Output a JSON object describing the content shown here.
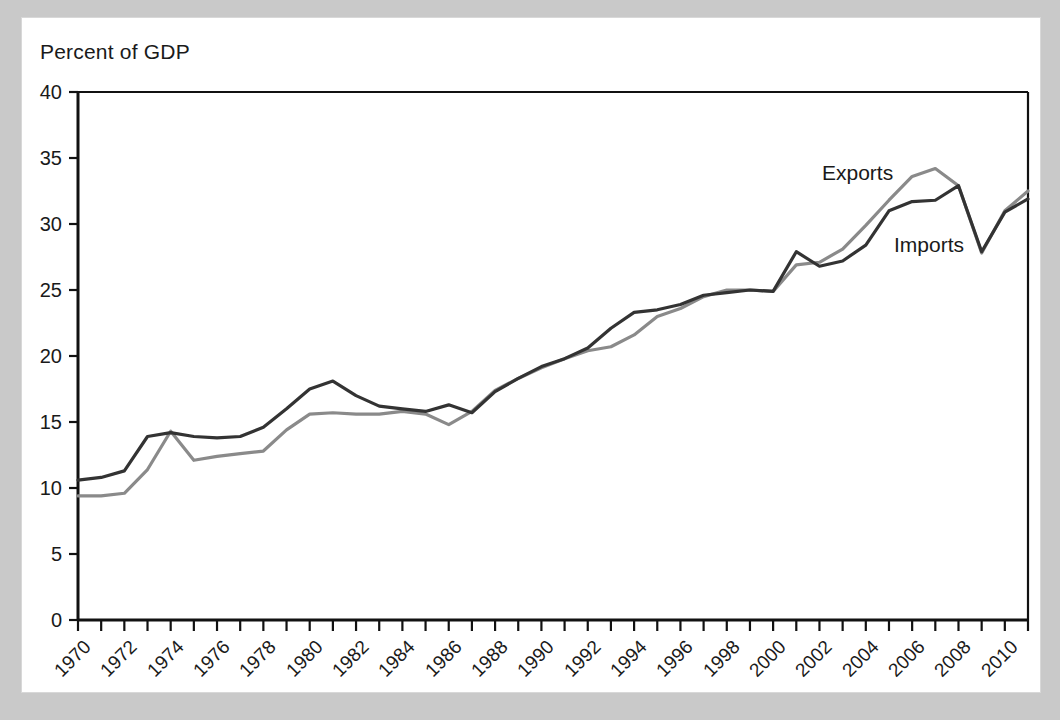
{
  "figure": {
    "axis_label": "Percent of GDP",
    "background_color": "#c9c9c9",
    "panel_color": "#ffffff"
  },
  "chart_data": {
    "type": "line",
    "title": "",
    "subtitle": "",
    "xlabel": "",
    "ylabel": "Percent of GDP",
    "xlim": [
      1970,
      2011
    ],
    "ylim": [
      0,
      40
    ],
    "grid": false,
    "legend_position": "inline-annotations",
    "ytick_labels": [
      "0",
      "5",
      "10",
      "15",
      "20",
      "25",
      "30",
      "35",
      "40"
    ],
    "ytick_values": [
      0,
      5,
      10,
      15,
      20,
      25,
      30,
      35,
      40
    ],
    "xtick_labels": [
      "1970",
      "1972",
      "1974",
      "1976",
      "1978",
      "1980",
      "1982",
      "1984",
      "1986",
      "1988",
      "1990",
      "1992",
      "1994",
      "1996",
      "1998",
      "2000",
      "2002",
      "2004",
      "2006",
      "2008",
      "2010"
    ],
    "xtick_values": [
      1970,
      1972,
      1974,
      1976,
      1978,
      1980,
      1982,
      1984,
      1986,
      1988,
      1990,
      1992,
      1994,
      1996,
      1998,
      2000,
      2002,
      2004,
      2006,
      2008,
      2010
    ],
    "minor_tick_values": [
      1971,
      1973,
      1975,
      1977,
      1979,
      1981,
      1983,
      1985,
      1987,
      1989,
      1991,
      1993,
      1995,
      1997,
      1999,
      2001,
      2003,
      2005,
      2007,
      2009,
      2011
    ],
    "x": [
      1970,
      1971,
      1972,
      1973,
      1974,
      1975,
      1976,
      1977,
      1978,
      1979,
      1980,
      1981,
      1982,
      1983,
      1984,
      1985,
      1986,
      1987,
      1988,
      1989,
      1990,
      1991,
      1992,
      1993,
      1994,
      1995,
      1996,
      1997,
      1998,
      1999,
      2000,
      2001,
      2002,
      2003,
      2004,
      2005,
      2006,
      2007,
      2008,
      2009,
      2010,
      2011
    ],
    "series": [
      {
        "name": "Imports",
        "color": "#333333",
        "annotation": "Imports",
        "values": [
          10.6,
          10.8,
          11.3,
          13.9,
          14.2,
          13.9,
          13.8,
          13.9,
          14.6,
          16.0,
          17.5,
          18.1,
          17.0,
          16.2,
          16.0,
          15.8,
          16.3,
          15.7,
          17.3,
          18.3,
          19.2,
          19.8,
          20.6,
          22.1,
          23.3,
          23.5,
          23.9,
          24.6,
          24.8,
          25.0,
          24.9,
          27.9,
          26.8,
          27.2,
          28.4,
          31.0,
          31.7,
          31.8,
          32.9,
          27.9,
          30.9,
          31.9
        ]
      },
      {
        "name": "Exports",
        "color": "#8a8a8a",
        "annotation": "Exports",
        "values": [
          9.4,
          9.4,
          9.6,
          11.4,
          14.3,
          12.1,
          12.4,
          12.6,
          12.8,
          14.4,
          15.6,
          15.7,
          15.6,
          15.6,
          15.8,
          15.6,
          14.8,
          15.8,
          17.4,
          18.3,
          19.1,
          19.8,
          20.4,
          20.7,
          21.6,
          23.0,
          23.6,
          24.5,
          25.0,
          25.0,
          24.9,
          26.9,
          27.1,
          28.1,
          29.9,
          31.8,
          33.6,
          34.2,
          32.9,
          27.8,
          31.0,
          32.5
        ]
      }
    ]
  }
}
